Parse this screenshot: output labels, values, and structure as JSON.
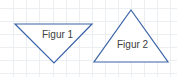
{
  "figures": [
    {
      "label": "Figur 1",
      "shape": "triangle-down"
    },
    {
      "label": "Figur 2",
      "shape": "triangle-up"
    }
  ],
  "colors": {
    "stroke": "#3a63a8",
    "grid": "#e8ecef"
  }
}
